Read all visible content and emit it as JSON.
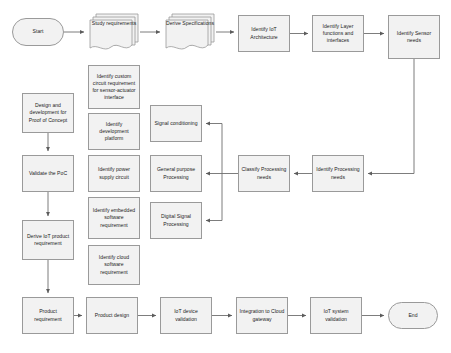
{
  "diagram": {
    "style": {
      "node_fill": "#f2f2f2",
      "node_stroke": "#9a9a9a",
      "connector": "#6e6e6e",
      "background": "#ffffff",
      "text": "#1c1c1c"
    },
    "nodes": [
      {
        "id": "start",
        "label": "Start",
        "shape": "terminator",
        "x": 12,
        "y": 18,
        "w": 52,
        "h": 28
      },
      {
        "id": "study",
        "label": "Study requirements",
        "shape": "multidocument",
        "x": 88,
        "y": 12,
        "w": 52,
        "h": 42
      },
      {
        "id": "derive_spec",
        "label": "Derive Specifications",
        "shape": "multidocument",
        "x": 164,
        "y": 12,
        "w": 52,
        "h": 42
      },
      {
        "id": "iot_arch",
        "label": "Identify IoT Architecture",
        "shape": "process",
        "x": 238,
        "y": 15,
        "w": 52,
        "h": 37
      },
      {
        "id": "layer_fn",
        "label": "Identify Layer functions and interfaces",
        "shape": "process",
        "x": 312,
        "y": 15,
        "w": 52,
        "h": 37
      },
      {
        "id": "sensor_needs",
        "label": "Identify Sensor needs",
        "shape": "process",
        "x": 388,
        "y": 15,
        "w": 52,
        "h": 44
      },
      {
        "id": "custom_circ",
        "label": "Identify custom circuit requirement for sensor-actuator interface",
        "shape": "process",
        "x": 88,
        "y": 65,
        "w": 52,
        "h": 44
      },
      {
        "id": "dev_platform",
        "label": "Identify development platform",
        "shape": "process",
        "x": 88,
        "y": 113,
        "w": 52,
        "h": 37
      },
      {
        "id": "power_supply",
        "label": "Identify power supply circuit",
        "shape": "process",
        "x": 88,
        "y": 155,
        "w": 52,
        "h": 37
      },
      {
        "id": "embedded_sw",
        "label": "Identify embedded software requirement",
        "shape": "process",
        "x": 88,
        "y": 197,
        "w": 52,
        "h": 42
      },
      {
        "id": "cloud_sw",
        "label": "Identify cloud software requirement",
        "shape": "process",
        "x": 88,
        "y": 245,
        "w": 52,
        "h": 40
      },
      {
        "id": "design_poc",
        "label": "Design and development for Proof of Concept",
        "shape": "process",
        "x": 22,
        "y": 93,
        "w": 52,
        "h": 40
      },
      {
        "id": "validate_poc",
        "label": "Validate the PoC",
        "shape": "process",
        "x": 22,
        "y": 155,
        "w": 52,
        "h": 37
      },
      {
        "id": "derive_prod",
        "label": "Derive IoT product requirement",
        "shape": "process",
        "x": 22,
        "y": 220,
        "w": 52,
        "h": 40
      },
      {
        "id": "sig_cond",
        "label": "Signal conditioning",
        "shape": "process",
        "x": 150,
        "y": 105,
        "w": 52,
        "h": 37
      },
      {
        "id": "gen_proc",
        "label": "General purpose Processing",
        "shape": "process",
        "x": 150,
        "y": 155,
        "w": 52,
        "h": 37
      },
      {
        "id": "dsp",
        "label": "Digital Signal Processing",
        "shape": "process",
        "x": 150,
        "y": 202,
        "w": 52,
        "h": 37
      },
      {
        "id": "classify",
        "label": "Classify Processing needs",
        "shape": "process",
        "x": 238,
        "y": 155,
        "w": 52,
        "h": 37
      },
      {
        "id": "ident_proc",
        "label": "Identify Processing needs",
        "shape": "process",
        "x": 312,
        "y": 155,
        "w": 52,
        "h": 37
      },
      {
        "id": "prod_req",
        "label": "Product requirement",
        "shape": "process",
        "x": 22,
        "y": 297,
        "w": 52,
        "h": 37
      },
      {
        "id": "prod_design",
        "label": "Product design",
        "shape": "process",
        "x": 86,
        "y": 297,
        "w": 52,
        "h": 37
      },
      {
        "id": "dev_valid",
        "label": "IoT device validation",
        "shape": "process",
        "x": 160,
        "y": 297,
        "w": 52,
        "h": 37
      },
      {
        "id": "cloud_gw",
        "label": "Integration to Cloud gateway",
        "shape": "process",
        "x": 236,
        "y": 297,
        "w": 52,
        "h": 37
      },
      {
        "id": "sys_valid",
        "label": "IoT system validation",
        "shape": "process",
        "x": 310,
        "y": 297,
        "w": 52,
        "h": 37
      },
      {
        "id": "end",
        "label": "End",
        "shape": "terminator",
        "x": 388,
        "y": 302,
        "w": 50,
        "h": 27
      }
    ],
    "edges": [
      {
        "from": "start",
        "to": "study",
        "label": ""
      },
      {
        "from": "study",
        "to": "derive_spec",
        "label": ""
      },
      {
        "from": "derive_spec",
        "to": "iot_arch",
        "label": ""
      },
      {
        "from": "iot_arch",
        "to": "layer_fn",
        "label": ""
      },
      {
        "from": "layer_fn",
        "to": "sensor_needs",
        "label": ""
      },
      {
        "from": "sensor_needs",
        "to": "ident_proc",
        "label": ""
      },
      {
        "from": "ident_proc",
        "to": "classify",
        "label": ""
      },
      {
        "from": "classify",
        "to": "sig_cond",
        "label": ""
      },
      {
        "from": "classify",
        "to": "gen_proc",
        "label": ""
      },
      {
        "from": "classify",
        "to": "dsp",
        "label": ""
      },
      {
        "from": "design_poc",
        "to": "validate_poc",
        "label": ""
      },
      {
        "from": "validate_poc",
        "to": "derive_prod",
        "label": ""
      },
      {
        "from": "derive_prod",
        "to": "prod_req",
        "label": ""
      },
      {
        "from": "prod_req",
        "to": "prod_design",
        "label": ""
      },
      {
        "from": "prod_design",
        "to": "dev_valid",
        "label": ""
      },
      {
        "from": "dev_valid",
        "to": "cloud_gw",
        "label": ""
      },
      {
        "from": "cloud_gw",
        "to": "sys_valid",
        "label": ""
      },
      {
        "from": "sys_valid",
        "to": "end",
        "label": ""
      }
    ]
  }
}
